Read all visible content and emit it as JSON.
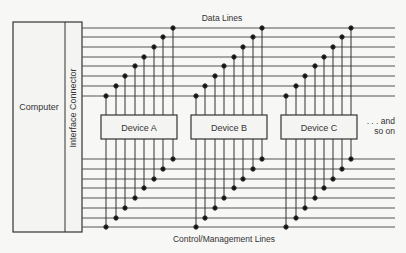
{
  "diagram": {
    "computer_label": "Computer",
    "connector_label": "Interface Connector",
    "data_lines_label": "Data Lines",
    "control_lines_label": "Control/Management Lines",
    "continuation_label_1": ". . . and",
    "continuation_label_2": "so on",
    "devices": [
      {
        "label": "Device A"
      },
      {
        "label": "Device B"
      },
      {
        "label": "Device C"
      }
    ],
    "data_line_count": 8,
    "control_line_count": 8,
    "colors": {
      "line": "#444444",
      "background": "#f7f7f5",
      "box_fill": "#f4f4f2"
    }
  }
}
